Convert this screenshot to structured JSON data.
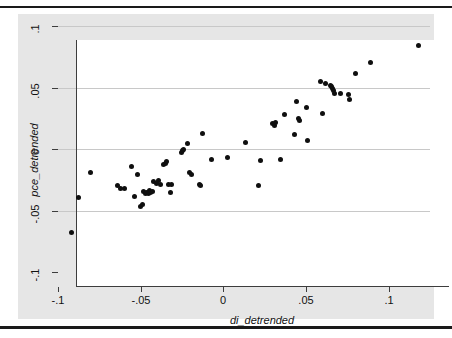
{
  "figure": {
    "background_color": "#ffffff",
    "graph_region_color": "#e6e6e6",
    "plot_panel_color": "#ffffff",
    "marker_color": "#0f0f0f",
    "gridline_color": "#c8c8c8",
    "axis_color": "#3d3d3d",
    "rule_color": "#1a1a1a"
  },
  "chart_data": {
    "type": "scatter",
    "title": "",
    "xlabel": "di_detrended",
    "ylabel": "pce_detrended",
    "xlim": [
      -0.1,
      0.125
    ],
    "ylim": [
      -0.1,
      0.1
    ],
    "xticks": [
      -0.1,
      -0.05,
      0,
      0.05,
      0.1
    ],
    "xticklabels": [
      "-.1",
      "-.05",
      "0",
      ".05",
      ".1"
    ],
    "yticks": [
      -0.1,
      -0.05,
      0,
      0.05,
      0.1
    ],
    "yticklabels": [
      "-.1",
      "-.05",
      "0",
      ".05",
      ".1"
    ],
    "grid": "horizontal",
    "legend": "none",
    "marker": "filled-circle",
    "points": [
      {
        "x": -0.092,
        "y": -0.068
      },
      {
        "x": -0.0875,
        "y": -0.0395
      },
      {
        "x": -0.0805,
        "y": -0.0195
      },
      {
        "x": -0.064,
        "y": -0.03
      },
      {
        "x": -0.062,
        "y": -0.0325
      },
      {
        "x": -0.06,
        "y": -0.0325
      },
      {
        "x": -0.0555,
        "y": -0.014
      },
      {
        "x": -0.054,
        "y": -0.039
      },
      {
        "x": -0.052,
        "y": -0.0205
      },
      {
        "x": -0.05,
        "y": -0.0465
      },
      {
        "x": -0.049,
        "y": -0.0455
      },
      {
        "x": -0.048,
        "y": -0.0345
      },
      {
        "x": -0.0472,
        "y": -0.036
      },
      {
        "x": -0.0462,
        "y": -0.035
      },
      {
        "x": -0.0452,
        "y": -0.0365
      },
      {
        "x": -0.0445,
        "y": -0.034
      },
      {
        "x": -0.0438,
        "y": -0.0355
      },
      {
        "x": -0.043,
        "y": -0.0345
      },
      {
        "x": -0.042,
        "y": -0.0265
      },
      {
        "x": -0.0405,
        "y": -0.028
      },
      {
        "x": -0.039,
        "y": -0.0255
      },
      {
        "x": -0.038,
        "y": -0.0285
      },
      {
        "x": -0.036,
        "y": -0.013
      },
      {
        "x": -0.035,
        "y": -0.0115
      },
      {
        "x": -0.0342,
        "y": -0.0105
      },
      {
        "x": -0.033,
        "y": -0.029
      },
      {
        "x": -0.0318,
        "y": -0.035
      },
      {
        "x": -0.0312,
        "y": -0.0285
      },
      {
        "x": -0.0255,
        "y": -0.003
      },
      {
        "x": -0.0248,
        "y": -0.0015
      },
      {
        "x": -0.024,
        "y": -0.0005
      },
      {
        "x": -0.0218,
        "y": 0.0045
      },
      {
        "x": -0.0205,
        "y": -0.0195
      },
      {
        "x": -0.0195,
        "y": -0.021
      },
      {
        "x": -0.0145,
        "y": -0.029
      },
      {
        "x": -0.0138,
        "y": -0.03
      },
      {
        "x": -0.0125,
        "y": 0.013
      },
      {
        "x": -0.007,
        "y": -0.0085
      },
      {
        "x": 0.0025,
        "y": -0.0065
      },
      {
        "x": 0.0135,
        "y": 0.005
      },
      {
        "x": 0.0215,
        "y": -0.03
      },
      {
        "x": 0.0225,
        "y": -0.009
      },
      {
        "x": 0.03,
        "y": 0.0205
      },
      {
        "x": 0.0308,
        "y": 0.0195
      },
      {
        "x": 0.0315,
        "y": 0.0215
      },
      {
        "x": 0.0348,
        "y": -0.0085
      },
      {
        "x": 0.037,
        "y": 0.028
      },
      {
        "x": 0.0428,
        "y": 0.012
      },
      {
        "x": 0.0442,
        "y": 0.039
      },
      {
        "x": 0.0455,
        "y": 0.025
      },
      {
        "x": 0.0462,
        "y": 0.0235
      },
      {
        "x": 0.05,
        "y": 0.0335
      },
      {
        "x": 0.0512,
        "y": 0.007
      },
      {
        "x": 0.0585,
        "y": 0.055
      },
      {
        "x": 0.06,
        "y": 0.029
      },
      {
        "x": 0.0618,
        "y": 0.0535
      },
      {
        "x": 0.0648,
        "y": 0.0515
      },
      {
        "x": 0.0655,
        "y": 0.0505
      },
      {
        "x": 0.066,
        "y": 0.049
      },
      {
        "x": 0.0668,
        "y": 0.0475
      },
      {
        "x": 0.0672,
        "y": 0.0455
      },
      {
        "x": 0.071,
        "y": 0.045
      },
      {
        "x": 0.0755,
        "y": 0.044
      },
      {
        "x": 0.0762,
        "y": 0.0405
      },
      {
        "x": 0.08,
        "y": 0.061
      },
      {
        "x": 0.089,
        "y": 0.0705
      },
      {
        "x": 0.118,
        "y": 0.084
      }
    ]
  }
}
